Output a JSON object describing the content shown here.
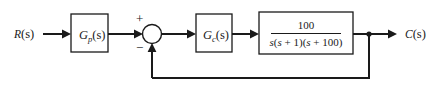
{
  "diagram": {
    "type": "control-system-block-diagram",
    "background_color": "#ffffff",
    "line_color": "#1a1a1a",
    "signals": {
      "input": {
        "label_var": "R",
        "label_arg": "(s)",
        "name": "reference-input"
      },
      "output": {
        "label_var": "C",
        "label_arg": "(s)",
        "name": "controlled-output"
      }
    },
    "summing_junction": {
      "name": "summing-junction",
      "plus_sign": "+",
      "minus_sign": "−",
      "plus_input": "forward",
      "minus_input": "feedback"
    },
    "blocks": [
      {
        "name": "prefilter-block",
        "label_var": "G",
        "label_sub": "p",
        "label_arg": "(s)",
        "role": "prefilter"
      },
      {
        "name": "controller-block",
        "label_var": "G",
        "label_sub": "c",
        "label_arg": "(s)",
        "role": "controller"
      },
      {
        "name": "plant-block",
        "role": "plant",
        "transfer_function": {
          "numerator": "100",
          "denominator_parts": [
            {
              "text": "s",
              "italic": true
            },
            {
              "text": "(",
              "italic": false
            },
            {
              "text": "s",
              "italic": true
            },
            {
              "text": " + 1)(",
              "italic": false
            },
            {
              "text": "s",
              "italic": true
            },
            {
              "text": " + 100)",
              "italic": false
            }
          ],
          "denominator_plain": "s(s + 1)(s + 100)"
        }
      }
    ],
    "feedback_path": {
      "name": "feedback-path",
      "unity_gain": true,
      "takeoff_node": "output-takeoff-node"
    }
  }
}
